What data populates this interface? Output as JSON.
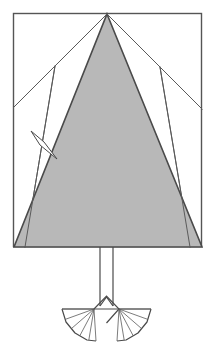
{
  "figure": {
    "type": "technical-line-diagram",
    "canvas": {
      "width": 215,
      "height": 347,
      "background": "#ffffff"
    },
    "colors": {
      "background": "#ffffff",
      "sail_fill": "#b8b8b8",
      "sliver_fill": "#ffffff",
      "stroke": "#4a4a4a",
      "frame_stroke": "#555555",
      "thin_stroke": "#5a5a5a"
    },
    "strokes": {
      "frame_width": 1.4,
      "sail_outline_width": 1.6,
      "guide_width": 1.0,
      "mast_width": 1.2,
      "fan_outline_width": 1.2,
      "fan_spoke_width": 0.8,
      "sliver_width": 1.0
    },
    "frame": {
      "name": "bounding-rectangle",
      "x": 13.5,
      "y": 13.5,
      "width": 188,
      "height": 233
    },
    "sail": {
      "name": "main-sail-triangle",
      "points": "107,14 202,247 14,247",
      "apex": {
        "x": 107,
        "y": 14
      },
      "base_left": {
        "x": 14,
        "y": 247
      },
      "base_right": {
        "x": 202,
        "y": 247
      }
    },
    "guides": [
      {
        "name": "guide-left-outer",
        "x1": 107,
        "y1": 14,
        "x2": 14,
        "y2": 107
      },
      {
        "name": "guide-left-inner",
        "x1": 55,
        "y1": 66,
        "x2": 25,
        "y2": 247
      },
      {
        "name": "guide-right-outer",
        "x1": 107,
        "y1": 14,
        "x2": 202,
        "y2": 109
      },
      {
        "name": "guide-right-inner",
        "x1": 160,
        "y1": 67,
        "x2": 190,
        "y2": 247
      }
    ],
    "sliver": {
      "name": "leech-telltale-sliver",
      "points": "31,131 44,142 57,159 40,145",
      "tip_upper": {
        "x": 31,
        "y": 131
      },
      "tip_lower": {
        "x": 57,
        "y": 159
      }
    },
    "mast": {
      "name": "mast-stem",
      "left_x": 100,
      "right_x": 113,
      "y_top": 247,
      "y_bottom": 306,
      "center_x": 106.5
    },
    "mast_foot": {
      "name": "mast-foot-chevron",
      "points": "100,306 106.5,297 113,306"
    },
    "fan_assembly": {
      "name": "base-fan-assembly",
      "center_notch": {
        "name": "center-notch-diamond",
        "points": "94,309 106.5,296 119,309 106.5,323"
      },
      "spar": {
        "name": "horizontal-spar",
        "x1": 62,
        "y1": 309,
        "x2": 151,
        "y2": 309
      },
      "left_fan": {
        "name": "left-fan",
        "hub": {
          "x": 94,
          "y": 309
        },
        "outer": "62,309 66,322 75,333 87,340 96,341",
        "spoke_count": 6
      },
      "right_fan": {
        "name": "right-fan",
        "hub": {
          "x": 119,
          "y": 309
        },
        "outer": "151,309 147,322 138,333 126,340 117,341",
        "spoke_count": 6
      }
    }
  }
}
